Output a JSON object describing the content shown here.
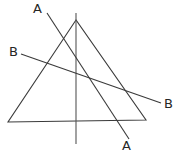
{
  "figure": {
    "type": "geometry-diagram",
    "width": 173,
    "height": 155,
    "background_color": "#ffffff",
    "stroke_color": "#3a3a3a",
    "stroke_width": 1.1,
    "labels": [
      {
        "id": "a-top",
        "text": "A",
        "x": 33,
        "y": 2
      },
      {
        "id": "b-left",
        "text": "B",
        "x": 9,
        "y": 45
      },
      {
        "id": "b-right",
        "text": "B",
        "x": 164,
        "y": 97
      },
      {
        "id": "a-bottom",
        "text": "A",
        "x": 122,
        "y": 139
      }
    ],
    "shapes": {
      "triangle": {
        "name": "triangle",
        "vertices": [
          {
            "x": 76,
            "y": 20
          },
          {
            "x": 8,
            "y": 122
          },
          {
            "x": 146,
            "y": 120
          }
        ]
      },
      "vertical_axis": {
        "name": "vertical-line",
        "x1": 76,
        "y1": 13,
        "x2": 76,
        "y2": 144
      },
      "line_a": {
        "name": "line-a",
        "x1": 47,
        "y1": 13,
        "x2": 129,
        "y2": 139
      },
      "line_b": {
        "name": "line-b",
        "x1": 21,
        "y1": 54,
        "x2": 161,
        "y2": 103
      }
    }
  }
}
